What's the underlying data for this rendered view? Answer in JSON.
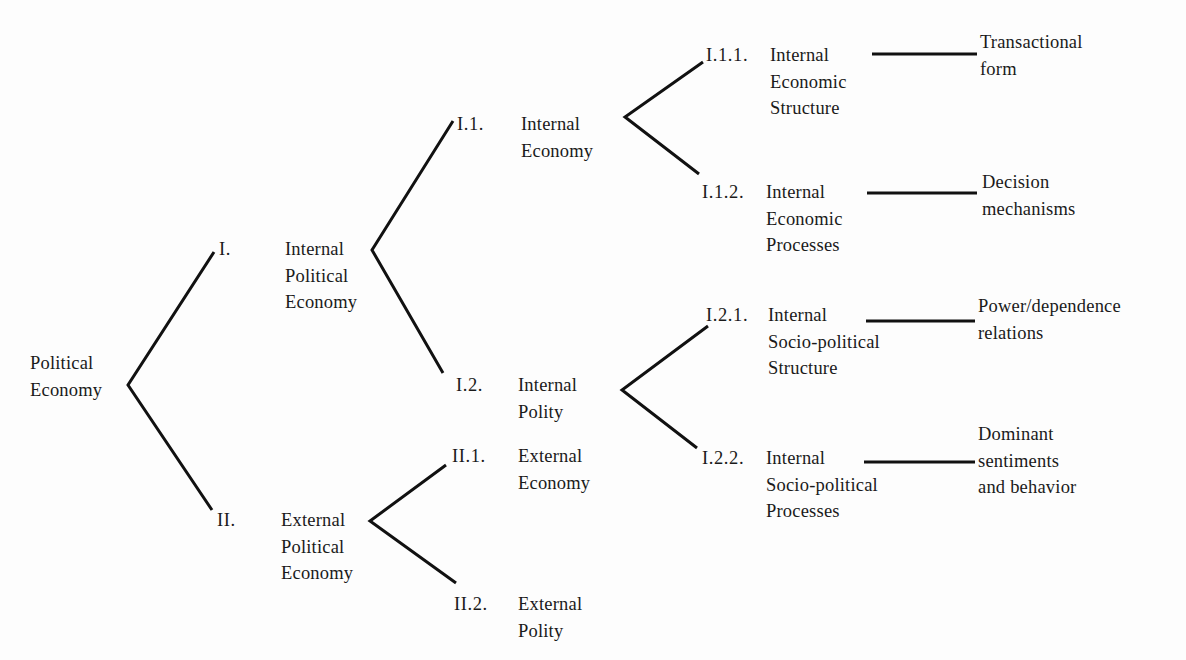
{
  "diagram": {
    "type": "tree",
    "orientation": "left-to-right",
    "line_color": "#111111",
    "root": {
      "label_lines": [
        "Political",
        "Economy"
      ]
    },
    "nodes": {
      "n1": {
        "number": "I.",
        "label_lines": [
          "Internal",
          "Political",
          "Economy"
        ]
      },
      "n2": {
        "number": "II.",
        "label_lines": [
          "External",
          "Political",
          "Economy"
        ]
      },
      "n11": {
        "number": "I.1.",
        "label_lines": [
          "Internal",
          "Economy"
        ]
      },
      "n12": {
        "number": "I.2.",
        "label_lines": [
          "Internal",
          "Polity"
        ]
      },
      "n21": {
        "number": "II.1.",
        "label_lines": [
          "External",
          "Economy"
        ]
      },
      "n22": {
        "number": "II.2.",
        "label_lines": [
          "External",
          "Polity"
        ]
      },
      "n111": {
        "number": "I.1.1.",
        "label_lines": [
          "Internal",
          "Economic",
          "Structure"
        ],
        "leaf_lines": [
          "Transactional",
          "form"
        ]
      },
      "n112": {
        "number": "I.1.2.",
        "label_lines": [
          "Internal",
          "Economic",
          "Processes"
        ],
        "leaf_lines": [
          "Decision",
          "mechanisms"
        ]
      },
      "n121": {
        "number": "I.2.1.",
        "label_lines": [
          "Internal",
          "Socio-political",
          "Structure"
        ],
        "leaf_lines": [
          "Power/dependence",
          "relations"
        ]
      },
      "n122": {
        "number": "I.2.2.",
        "label_lines": [
          "Internal",
          "Socio-political",
          "Processes"
        ],
        "leaf_lines": [
          "Dominant",
          "sentiments",
          "and behavior"
        ]
      }
    },
    "edges": [
      [
        "root",
        "n1"
      ],
      [
        "root",
        "n2"
      ],
      [
        "n1",
        "n11"
      ],
      [
        "n1",
        "n12"
      ],
      [
        "n2",
        "n21"
      ],
      [
        "n2",
        "n22"
      ],
      [
        "n11",
        "n111"
      ],
      [
        "n11",
        "n112"
      ],
      [
        "n12",
        "n121"
      ],
      [
        "n12",
        "n122"
      ],
      [
        "n111",
        "leaf-transactional-form"
      ],
      [
        "n112",
        "leaf-decision-mechanisms"
      ],
      [
        "n121",
        "leaf-power-dependence-relations"
      ],
      [
        "n122",
        "leaf-dominant-sentiments"
      ]
    ]
  }
}
